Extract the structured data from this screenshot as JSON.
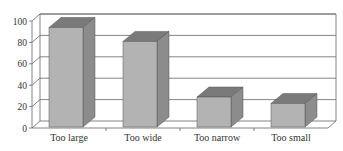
{
  "chart_data": {
    "type": "bar",
    "style": "3d-column",
    "title": "",
    "xlabel": "",
    "ylabel": "",
    "categories": [
      "Too large",
      "Too wide",
      "Too narrow",
      "Too small"
    ],
    "values": [
      93,
      80,
      28,
      22
    ],
    "ylim": [
      0,
      100
    ],
    "yticks": [
      0,
      20,
      40,
      60,
      80,
      100
    ],
    "grid": true,
    "legend": null
  },
  "colors": {
    "bar_front": "#b3b3b3",
    "bar_side": "#8c8c8c",
    "bar_top": "#7a7a7a",
    "grid": "#666666",
    "axis_text": "#333333"
  }
}
